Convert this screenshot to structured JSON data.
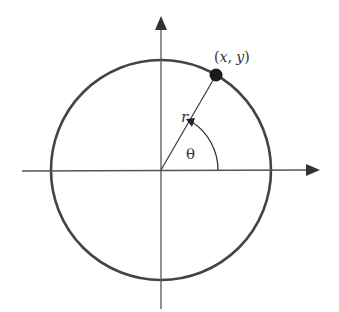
{
  "diagram": {
    "colors": {
      "circle": "#444444",
      "axis": "#555555",
      "point": "#1a1a1a",
      "text": "#333333",
      "background": "#ffffff"
    },
    "labels": {
      "point": "(x, y)",
      "radius": "r",
      "angle": "θ"
    },
    "geometry": {
      "origin": [
        161,
        170
      ],
      "radius": 110,
      "point": [
        216,
        75
      ],
      "x_axis": [
        22,
        318
      ],
      "y_axis": [
        17,
        309
      ]
    }
  }
}
